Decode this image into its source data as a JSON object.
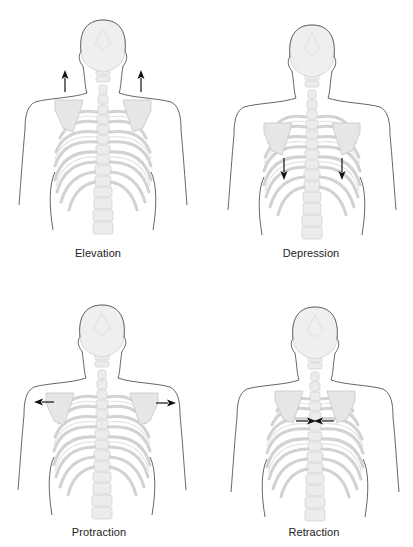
{
  "figure": {
    "panels": [
      {
        "id": "elevation",
        "label": "Elevation",
        "arrow_direction": "up",
        "arrow_count": 2
      },
      {
        "id": "depression",
        "label": "Depression",
        "arrow_direction": "down",
        "arrow_count": 2
      },
      {
        "id": "protraction",
        "label": "Protraction",
        "arrow_direction": "outward",
        "arrow_count": 2
      },
      {
        "id": "retraction",
        "label": "Retraction",
        "arrow_direction": "inward",
        "arrow_count": 2
      }
    ]
  },
  "colors": {
    "outline": "#555555",
    "bone_fill": "#ebebeb",
    "bone_stroke": "#c8c8c8",
    "arrow": "#111111",
    "label_text": "#222222",
    "background": "#ffffff"
  }
}
